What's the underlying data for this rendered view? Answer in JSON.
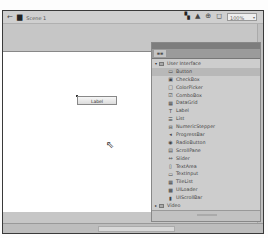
{
  "toolbar": {
    "back_icon": "←",
    "scene_icon": "▆",
    "scene_label": "Scene 1",
    "edit_symbols_icon": "▚",
    "edit_scene_icon": "▲",
    "rotate_icon": "⊕",
    "clip_icon": "◻",
    "zoom_value": "100%",
    "zoom_arrow": "▾"
  },
  "stage": {
    "component_label": "Label",
    "cursor_icon": "⇖"
  },
  "panel": {
    "tab_label": "≡≡",
    "groups": [
      {
        "label": "User Interface",
        "expanded": true,
        "twisty": "▾",
        "items": [
          {
            "label": "Button",
            "icon": "▭",
            "selected": true
          },
          {
            "label": "CheckBox",
            "icon": "▣"
          },
          {
            "label": "ColorPicker",
            "icon": "□"
          },
          {
            "label": "ComboBox",
            "icon": "☑"
          },
          {
            "label": "DataGrid",
            "icon": "▦"
          },
          {
            "label": "Label",
            "icon": "T"
          },
          {
            "label": "List",
            "icon": "☰"
          },
          {
            "label": "NumericStepper",
            "icon": "⊟"
          },
          {
            "label": "ProgressBar",
            "icon": "◂"
          },
          {
            "label": "RadioButton",
            "icon": "◉"
          },
          {
            "label": "ScrollPane",
            "icon": "▤"
          },
          {
            "label": "Slider",
            "icon": "⇔"
          },
          {
            "label": "TextArea",
            "icon": "▯"
          },
          {
            "label": "TextInput",
            "icon": "▭"
          },
          {
            "label": "TileList",
            "icon": "▦"
          },
          {
            "label": "UILoader",
            "icon": "▩"
          },
          {
            "label": "UIScrollBar",
            "icon": "▮"
          }
        ]
      },
      {
        "label": "Video",
        "expanded": false,
        "twisty": "▸",
        "items": []
      }
    ]
  }
}
